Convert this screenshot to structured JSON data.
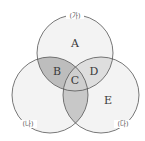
{
  "diagram": {
    "type": "venn-3",
    "sets": [
      {
        "id": "ga",
        "label": "(가)",
        "cx": 75,
        "cy": 53,
        "r": 38
      },
      {
        "id": "na",
        "label": "(나)",
        "cx": 50,
        "cy": 95,
        "r": 38
      },
      {
        "id": "da",
        "label": "(다)",
        "cx": 101,
        "cy": 95,
        "r": 38
      }
    ],
    "regions": {
      "A": {
        "label": "A",
        "sets": [
          "ga"
        ]
      },
      "B": {
        "label": "B",
        "sets": [
          "ga",
          "na"
        ]
      },
      "C": {
        "label": "C",
        "sets": [
          "ga",
          "na",
          "da"
        ]
      },
      "D": {
        "label": "D",
        "sets": [
          "ga",
          "da"
        ]
      },
      "E": {
        "label": "E",
        "sets": [
          "da"
        ]
      }
    },
    "colors": {
      "circle_fill": "#f3f3f3",
      "stroke": "#555555",
      "region_B": "#bdbdbd",
      "region_C": "#cfcfcf",
      "region_D": "#dedede",
      "region_na_da": "#c8c8c8"
    }
  }
}
